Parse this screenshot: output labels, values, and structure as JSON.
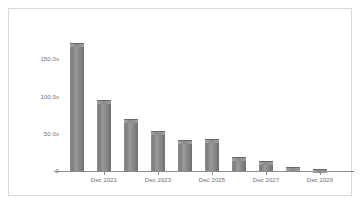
{
  "chart_data": {
    "type": "bar",
    "title": "",
    "subtitle": "",
    "xlabel": "",
    "ylabel": "",
    "grid": false,
    "legend": null,
    "categories": [
      "Dec 2020",
      "Dec 2021",
      "Dec 2022",
      "Dec 2023",
      "Dec 2024",
      "Dec 2025",
      "Dec 2026",
      "Dec 2027",
      "Dec 2028",
      "Dec 2029"
    ],
    "values": [
      172.0,
      95.0,
      70.0,
      54.0,
      42.0,
      43.0,
      19.0,
      13.0,
      6.0,
      3.0
    ],
    "series": [
      {
        "name": "",
        "values": [
          172.0,
          95.0,
          70.0,
          54.0,
          42.0,
          43.0,
          19.0,
          13.0,
          6.0,
          3.0
        ]
      }
    ],
    "ylim": [
      0,
      200
    ],
    "yticks": [
      0,
      50,
      100,
      150
    ],
    "ytick_labels": [
      "0",
      "50.0x",
      "100.0x",
      "150.0x"
    ],
    "xtick_labels": [
      "Dec 2021",
      "Dec 2023",
      "Dec 2025",
      "Dec 2027",
      "Dec 2029"
    ],
    "xtick_categories": [
      "Dec 2021",
      "Dec 2023",
      "Dec 2025",
      "Dec 2027",
      "Dec 2029"
    ],
    "bar_color": "#8a8a8a",
    "axis_color": "#8c8c8c",
    "text_color": "#6e6e6e",
    "frame_color": "#d9d9d9",
    "background_color": "#ffffff"
  }
}
